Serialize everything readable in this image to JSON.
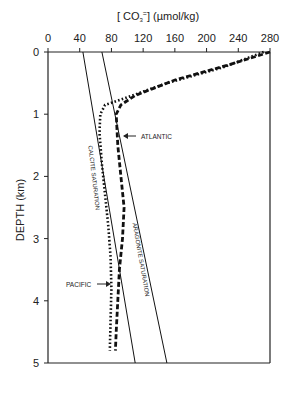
{
  "chart_data": {
    "type": "line",
    "title": "",
    "xlabel": "[ CO3= ] (µmol/kg)",
    "ylabel": "DEPTH (km)",
    "xlim": [
      0,
      280
    ],
    "ylim": [
      0,
      5
    ],
    "x_ticks": [
      0,
      40,
      80,
      120,
      160,
      200,
      240,
      280
    ],
    "y_ticks": [
      0,
      1,
      2,
      3,
      4,
      5
    ],
    "x_axis_position": "top",
    "y_inverted": true,
    "grid": false,
    "series": [
      {
        "name": "CALCITE SATURATION",
        "style": "solid",
        "points": [
          [
            44,
            0
          ],
          [
            110,
            5
          ]
        ]
      },
      {
        "name": "ARAGONITE SATURATION",
        "style": "solid",
        "points": [
          [
            68,
            0
          ],
          [
            150,
            5
          ]
        ]
      },
      {
        "name": "ATLANTIC",
        "style": "dashed",
        "points": [
          [
            280,
            0
          ],
          [
            230,
            0.2
          ],
          [
            160,
            0.45
          ],
          [
            110,
            0.7
          ],
          [
            92,
            0.85
          ],
          [
            86,
            1.0
          ],
          [
            88,
            1.5
          ],
          [
            92,
            2.0
          ],
          [
            96,
            2.5
          ],
          [
            94,
            3.0
          ],
          [
            90,
            3.5
          ],
          [
            88,
            4.0
          ],
          [
            86,
            4.5
          ],
          [
            85,
            4.8
          ]
        ]
      },
      {
        "name": "PACIFIC",
        "style": "dotted",
        "points": [
          [
            272,
            0
          ],
          [
            220,
            0.25
          ],
          [
            150,
            0.5
          ],
          [
            95,
            0.75
          ],
          [
            72,
            0.85
          ],
          [
            66,
            1.0
          ],
          [
            65,
            1.3
          ],
          [
            68,
            1.8
          ],
          [
            72,
            2.3
          ],
          [
            76,
            2.8
          ],
          [
            79,
            3.3
          ],
          [
            80,
            3.8
          ],
          [
            79,
            4.3
          ],
          [
            78,
            4.8
          ]
        ]
      }
    ],
    "annotations": [
      {
        "text": "ATLANTIC",
        "arrow_to": [
          96,
          1.3
        ]
      },
      {
        "text": "PACIFIC",
        "arrow_to": [
          80,
          3.5
        ]
      },
      {
        "text": "CALCITE SATURATION",
        "rotated": true
      },
      {
        "text": "ARAGONITE SATURATION",
        "rotated": true
      }
    ]
  },
  "labels": {
    "xlabel": "[ CO",
    "xlabel_sub": "3",
    "xlabel_sup": "=",
    "xlabel_rest": "] (µmol/kg)",
    "ylabel": "DEPTH (km)",
    "calcite": "CALCITE SATURATION",
    "aragonite": "ARAGONITE SATURATION",
    "atlantic": "ATLANTIC",
    "pacific": "PACIFIC"
  }
}
